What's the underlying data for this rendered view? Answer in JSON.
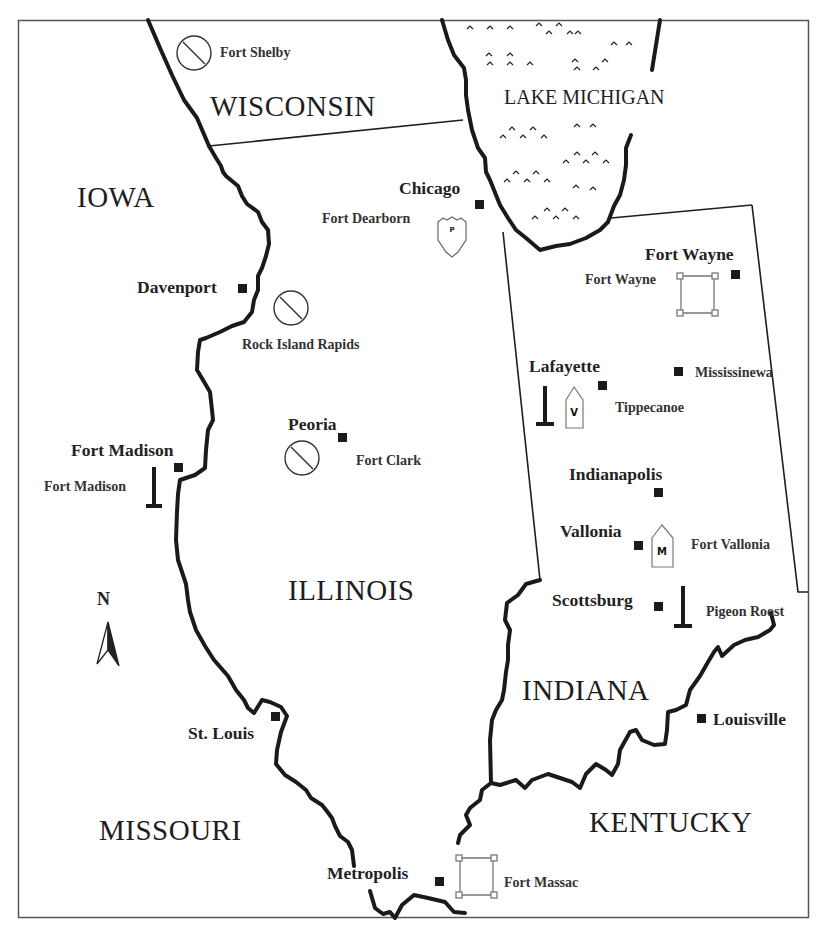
{
  "map": {
    "frame": {
      "x": 18,
      "y": 20,
      "width": 791,
      "height": 898
    },
    "colors": {
      "background": "#ffffff",
      "ink": "#1a1a1a",
      "frame": "#555555",
      "symbol_outline": "#777777"
    },
    "states": {
      "wisconsin": "WISCONSIN",
      "iowa": "IOWA",
      "illinois": "ILLINOIS",
      "indiana": "INDIANA",
      "missouri": "MISSOURI",
      "kentucky": "KENTUCKY"
    },
    "water": {
      "lake_michigan": "LAKE MICHIGAN"
    },
    "cities": [
      {
        "id": "chicago",
        "label": "Chicago"
      },
      {
        "id": "davenport",
        "label": "Davenport"
      },
      {
        "id": "peoria",
        "label": "Peoria"
      },
      {
        "id": "fort_madison",
        "label": "Fort Madison"
      },
      {
        "id": "st_louis",
        "label": "St. Louis"
      },
      {
        "id": "metropolis",
        "label": "Metropolis"
      },
      {
        "id": "fort_wayne",
        "label": "Fort Wayne"
      },
      {
        "id": "lafayette",
        "label": "Lafayette"
      },
      {
        "id": "indianapolis",
        "label": "Indianapolis"
      },
      {
        "id": "vallonia",
        "label": "Vallonia"
      },
      {
        "id": "scottsburg",
        "label": "Scottsburg"
      },
      {
        "id": "louisville",
        "label": "Louisville"
      },
      {
        "id": "mississinewa",
        "label": "Mississinewa"
      }
    ],
    "sites": [
      {
        "id": "fort_shelby",
        "label": "Fort Shelby",
        "symbol": "prohibited-circle"
      },
      {
        "id": "fort_dearborn",
        "label": "Fort Dearborn",
        "symbol": "shield",
        "glyph": "P"
      },
      {
        "id": "rock_island_rapids",
        "label": "Rock Island Rapids",
        "symbol": "prohibited-circle"
      },
      {
        "id": "fort_clark",
        "label": "Fort Clark",
        "symbol": "prohibited-circle"
      },
      {
        "id": "fort_madison_site",
        "label": "Fort Madison",
        "symbol": "monument"
      },
      {
        "id": "fort_wayne_site",
        "label": "Fort Wayne",
        "symbol": "fort-square"
      },
      {
        "id": "tippecanoe",
        "label": "Tippecanoe",
        "symbol": "monument-and-house",
        "glyph": "V"
      },
      {
        "id": "fort_vallonia",
        "label": "Fort Vallonia",
        "symbol": "house",
        "glyph": "M"
      },
      {
        "id": "pigeon_roost",
        "label": "Pigeon Roost",
        "symbol": "monument"
      },
      {
        "id": "fort_massac",
        "label": "Fort Massac",
        "symbol": "fort-square"
      }
    ],
    "compass": {
      "label": "N",
      "icon": "north-arrow"
    }
  }
}
